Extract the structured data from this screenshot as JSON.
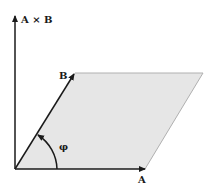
{
  "diagram": {
    "labels": {
      "cross_product": "A × B",
      "vector_b": "B",
      "vector_a": "A",
      "angle": "φ"
    },
    "colors": {
      "fill": "#e6e6e6",
      "stroke": "#1a1a1a",
      "edge": "#b0b0b0"
    }
  }
}
